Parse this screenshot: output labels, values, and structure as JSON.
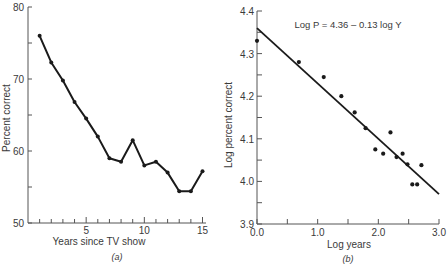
{
  "chart_data": [
    {
      "type": "line",
      "panel_label": "(a)",
      "title": "",
      "xlabel": "Years since TV show",
      "ylabel": "Percent correct",
      "xlim": [
        0,
        15.5
      ],
      "ylim": [
        50,
        80
      ],
      "xticks": [
        5,
        10,
        15
      ],
      "xticks_minor": [
        1,
        2,
        3,
        4,
        5,
        6,
        7,
        8,
        9,
        10,
        11,
        12,
        13,
        14,
        15
      ],
      "yticks": [
        50,
        60,
        70,
        80
      ],
      "yticks_minor": [
        55,
        65,
        75
      ],
      "grid": false,
      "x": [
        1,
        2,
        3,
        4,
        5,
        6,
        7,
        8,
        9,
        10,
        11,
        12,
        13,
        14,
        15
      ],
      "values": [
        76,
        72.3,
        69.8,
        66.8,
        64.5,
        62,
        59,
        58.5,
        61.5,
        58,
        58.5,
        57,
        54.4,
        54.4,
        57.2
      ]
    },
    {
      "type": "scatter",
      "panel_label": "(b)",
      "title": "",
      "annotation": "Log P = 4.36 – 0.13 log Y",
      "xlabel": "Log years",
      "ylabel": "Log percent correct",
      "xlim": [
        0.0,
        3.0
      ],
      "ylim": [
        3.9,
        4.4
      ],
      "xticks": [
        "0.0",
        "1.0",
        "2.0",
        "3.0"
      ],
      "xticks_minor": [
        0.5,
        1.5,
        2.5
      ],
      "yticks": [
        "3.9",
        "4.0",
        "4.1",
        "4.2",
        "4.3",
        "4.4"
      ],
      "yticks_minor": [
        3.95,
        4.05,
        4.15,
        4.25,
        4.35
      ],
      "grid": false,
      "points": [
        [
          0.0,
          4.33
        ],
        [
          0.69,
          4.28
        ],
        [
          1.1,
          4.245
        ],
        [
          1.39,
          4.2
        ],
        [
          1.61,
          4.162
        ],
        [
          1.79,
          4.125
        ],
        [
          1.95,
          4.075
        ],
        [
          2.08,
          4.065
        ],
        [
          2.2,
          4.115
        ],
        [
          2.3,
          4.057
        ],
        [
          2.4,
          4.065
        ],
        [
          2.48,
          4.04
        ],
        [
          2.56,
          3.993
        ],
        [
          2.64,
          3.993
        ],
        [
          2.71,
          4.038
        ]
      ],
      "fit_line": {
        "intercept": 4.36,
        "slope": -0.13,
        "x_range": [
          0.0,
          3.0
        ]
      }
    }
  ]
}
